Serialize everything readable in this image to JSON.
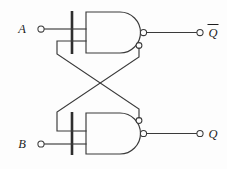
{
  "diagram": {
    "stroke_color": "#3a3a3a",
    "background_color": "#fdfdfd",
    "label_color": "#1d1d1d"
  },
  "inputs": [
    {
      "id": "A",
      "label": "A",
      "terminal": "open-circle",
      "x": 36,
      "y": 29
    },
    {
      "id": "B",
      "label": "B",
      "terminal": "open-circle",
      "x": 36,
      "y": 144
    }
  ],
  "outputs": [
    {
      "id": "Qbar",
      "label": "Q",
      "overbar": true,
      "terminal": "open-circle",
      "x": 203,
      "y": 33
    },
    {
      "id": "Q",
      "label": "Q",
      "overbar": false,
      "terminal": "open-circle",
      "x": 203,
      "y": 133
    }
  ],
  "gates": [
    {
      "id": "nand-top",
      "type": "NAND",
      "inputs": 2,
      "output": "Qbar"
    },
    {
      "id": "nand-bottom",
      "type": "NAND",
      "inputs": 2,
      "output": "Q"
    }
  ],
  "feedback": [
    {
      "from": "nand-top-output",
      "to": "nand-bottom-input-1"
    },
    {
      "from": "nand-bottom-output",
      "to": "nand-top-input-2"
    }
  ]
}
